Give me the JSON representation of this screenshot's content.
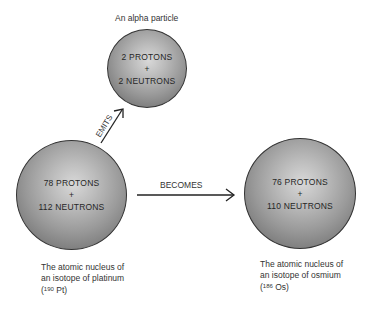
{
  "alpha": {
    "caption": "An alpha particle",
    "line1": "2 PROTONS",
    "plus": "+",
    "line2": "2 NEUTRONS"
  },
  "platinum": {
    "line1": "78 PROTONS",
    "plus": "+",
    "line2": "112 NEUTRONS",
    "caption_line1": "The atomic nucleus of",
    "caption_line2": "an isotope of platinum",
    "symbol_open": "(",
    "mass_number": "190",
    "symbol": " Pt)"
  },
  "osmium": {
    "line1": "76 PROTONS",
    "plus": "+",
    "line2": "110 NEUTRONS",
    "caption_line1": "The atomic nucleus of",
    "caption_line2": "an isotope of osmium",
    "symbol_open": "(",
    "mass_number": "186",
    "symbol": " Os)"
  },
  "arrows": {
    "emits_label": "EMITS",
    "becomes_label": "BECOMES"
  },
  "colors": {
    "sphere_highlight": "#d8d8d8",
    "sphere_shadow": "#6a6a6a",
    "outline": "#333333"
  }
}
